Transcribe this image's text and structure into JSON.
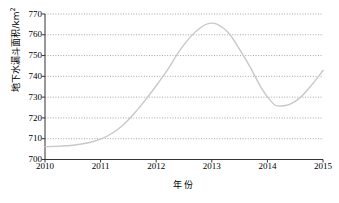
{
  "chart_data": {
    "type": "line",
    "title": "",
    "xlabel": "年份",
    "ylabel": "地下水漏斗面积/km2",
    "ylabel_main": "地下水漏斗面积/km",
    "ylabel_sup": "2",
    "xlim": [
      2010,
      2015
    ],
    "ylim": [
      700,
      770
    ],
    "y_ticks": [
      700,
      710,
      720,
      730,
      740,
      750,
      760,
      770
    ],
    "x_ticks": [
      2010,
      2011,
      2012,
      2013,
      2014,
      2015
    ],
    "grid": "horizontal-dotted",
    "legend": "none",
    "series": [
      {
        "name": "地下水漏斗面积",
        "color": "#c8c8c8",
        "x": [
          2010.0,
          2010.2,
          2010.4,
          2010.6,
          2010.8,
          2011.0,
          2011.2,
          2011.4,
          2011.6,
          2011.8,
          2012.0,
          2012.2,
          2012.4,
          2012.6,
          2012.8,
          2012.95,
          2013.1,
          2013.3,
          2013.5,
          2013.7,
          2013.9,
          2014.1,
          2014.2,
          2014.4,
          2014.6,
          2014.8,
          2015.0
        ],
        "values": [
          706.2,
          706.3,
          706.6,
          707.2,
          708.2,
          709.8,
          712.5,
          716.5,
          722.0,
          728.5,
          735.5,
          743.0,
          751.5,
          758.5,
          763.5,
          765.5,
          765.0,
          761.0,
          753.0,
          744.0,
          734.0,
          727.0,
          725.8,
          726.5,
          730.0,
          736.0,
          742.8
        ]
      }
    ]
  }
}
